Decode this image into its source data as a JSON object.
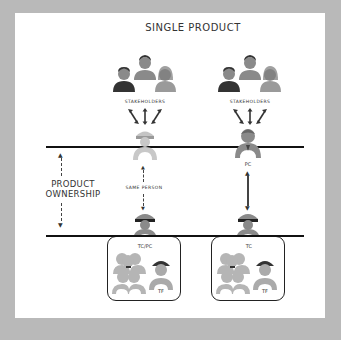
{
  "title": "SINGLE PRODUCT",
  "side_label": {
    "line1": "PRODUCT",
    "line2": "OWNERSHIP"
  },
  "left_column": {
    "stakeholders_label": "STAKEHOLDERS",
    "top_role_label": "",
    "connector_label": "SAME PERSON",
    "connector_style": "dashed",
    "bottom_role_label": "TC/PC",
    "team_member_label": "TF"
  },
  "right_column": {
    "stakeholders_label": "STAKEHOLDERS",
    "top_role_label": "PC",
    "connector_style": "solid-double-arrow",
    "bottom_role_label": "TC",
    "team_member_label": "TF"
  },
  "colors": {
    "background": "#b9b9b9",
    "panel": "#ffffff",
    "line": "#111111",
    "figure_light": "#b0b0b0",
    "figure_mid": "#8a8a8a",
    "figure_dark": "#333333"
  }
}
